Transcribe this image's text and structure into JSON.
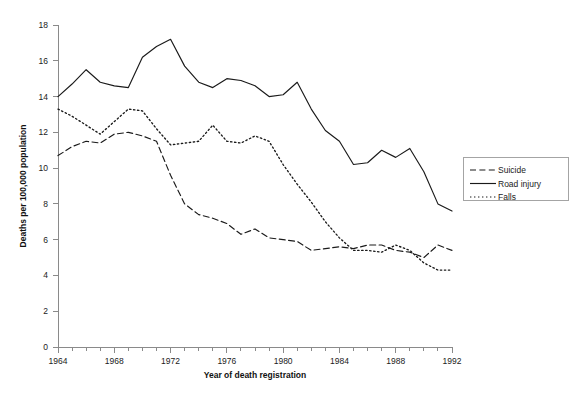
{
  "chart_data": {
    "type": "line",
    "title": "",
    "xlabel": "Year of death registration",
    "ylabel": "Deaths per 100,000 population",
    "xlim": [
      1964,
      1992
    ],
    "ylim": [
      0,
      18
    ],
    "ytick_step": 2,
    "xtick_step": 1,
    "xtick_label_step": 4,
    "grid": false,
    "legend_position": "right",
    "yticks": [
      0,
      2,
      4,
      6,
      8,
      10,
      12,
      14,
      16,
      18
    ],
    "ytick_labels": [
      "0",
      "2",
      "4",
      "6",
      "8",
      "10",
      "12",
      "14",
      "16",
      "18"
    ],
    "xticks": [
      1964,
      1965,
      1966,
      1967,
      1968,
      1969,
      1970,
      1971,
      1972,
      1973,
      1974,
      1975,
      1976,
      1977,
      1978,
      1979,
      1980,
      1981,
      1982,
      1983,
      1984,
      1985,
      1986,
      1987,
      1988,
      1989,
      1990,
      1991,
      1992
    ],
    "xtick_labels": [
      "1964",
      "1968",
      "1972",
      "1976",
      "1980",
      "1984",
      "1988",
      "1992"
    ],
    "xtick_labelled_values": [
      1964,
      1968,
      1972,
      1976,
      1980,
      1984,
      1988,
      1992
    ],
    "x": [
      1964,
      1965,
      1966,
      1967,
      1968,
      1969,
      1970,
      1971,
      1972,
      1973,
      1974,
      1975,
      1976,
      1977,
      1978,
      1979,
      1980,
      1981,
      1982,
      1983,
      1984,
      1985,
      1986,
      1987,
      1988,
      1989,
      1990,
      1991,
      1992
    ],
    "series": [
      {
        "name": "Suicide",
        "style": "dashed",
        "color": "#1a1a1a",
        "values": [
          10.7,
          11.2,
          11.5,
          11.4,
          11.9,
          12.0,
          11.8,
          11.5,
          9.6,
          8.0,
          7.4,
          7.2,
          6.9,
          6.3,
          6.6,
          6.1,
          6.0,
          5.9,
          5.4,
          5.5,
          5.6,
          5.5,
          5.7,
          5.7,
          5.4,
          5.3,
          5.0,
          5.7,
          5.4
        ]
      },
      {
        "name": "Road injury",
        "style": "solid",
        "color": "#1a1a1a",
        "values": [
          14.0,
          14.7,
          15.5,
          14.8,
          14.6,
          14.5,
          16.2,
          16.8,
          17.2,
          15.7,
          14.8,
          14.5,
          15.0,
          14.9,
          14.6,
          14.0,
          14.1,
          14.8,
          13.3,
          12.1,
          11.5,
          10.2,
          10.3,
          11.0,
          10.6,
          11.1,
          9.8,
          8.0,
          7.6
        ]
      },
      {
        "name": "Falls",
        "style": "dotted",
        "color": "#1a1a1a",
        "values": [
          13.3,
          12.9,
          12.4,
          11.9,
          12.6,
          13.3,
          13.2,
          12.2,
          11.3,
          11.4,
          11.5,
          12.4,
          11.5,
          11.4,
          11.8,
          11.5,
          10.2,
          9.1,
          8.1,
          7.0,
          6.1,
          5.4,
          5.4,
          5.3,
          5.7,
          5.4,
          4.7,
          4.3,
          4.3
        ]
      }
    ]
  },
  "legend": {
    "items": [
      {
        "label": "Suicide",
        "style": "dashed"
      },
      {
        "label": "Road injury",
        "style": "solid"
      },
      {
        "label": "Falls",
        "style": "dotted"
      }
    ]
  }
}
